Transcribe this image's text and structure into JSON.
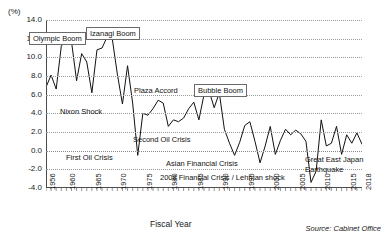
{
  "unit_label": "(%)",
  "axis_title": "Fiscal Year",
  "source": "Source: Cabinet Office",
  "annotations": {
    "olympic_boom": "Olympic Boom",
    "izanagi_boom": "Izanagi Boom",
    "nixon_shock": "Nixon Shock",
    "plaza_accord": "Plaza Accord",
    "bubble_boom": "Bubble Boom",
    "first_oil_crisis": "First Oil Crisis",
    "second_oil_crisis": "Second Oil Crisis",
    "asian_financial_crisis": "Asian Financial Crisis",
    "lehman": "2008 Financial Crisis /  Lehman shock",
    "great_east_japan": "Great East Japan Earthquake"
  },
  "chart_data": {
    "type": "line",
    "title": "",
    "xlabel": "Fiscal Year",
    "ylabel": "(%)",
    "ylim": [
      -4.0,
      14.0
    ],
    "ytick_values": [
      -4.0,
      -2.0,
      0.0,
      2.0,
      4.0,
      6.0,
      8.0,
      10.0,
      12.0,
      14.0
    ],
    "ytick_labels": [
      "-4.0",
      "-2.0",
      "0.0",
      "2.0",
      "4.0",
      "6.0",
      "8.0",
      "10.0",
      "12.0",
      "14.0"
    ],
    "xlim": [
      1956,
      2018
    ],
    "xtick_labels": [
      "1956",
      "1960",
      "1965",
      "1970",
      "1975",
      "1980",
      "1985",
      "1990",
      "1995",
      "2000",
      "2005",
      "2010",
      "2015",
      "2018"
    ],
    "xtick_values": [
      1956,
      1960,
      1965,
      1970,
      1975,
      1980,
      1985,
      1990,
      1995,
      2000,
      2005,
      2010,
      2015,
      2018
    ],
    "grid": true,
    "legend": false,
    "x": [
      1956,
      1957,
      1958,
      1959,
      1960,
      1961,
      1962,
      1963,
      1964,
      1965,
      1966,
      1967,
      1968,
      1969,
      1970,
      1971,
      1972,
      1973,
      1974,
      1975,
      1976,
      1977,
      1978,
      1979,
      1980,
      1981,
      1982,
      1983,
      1984,
      1985,
      1986,
      1987,
      1988,
      1989,
      1990,
      1991,
      1992,
      1993,
      1994,
      1995,
      1996,
      1997,
      1998,
      1999,
      2000,
      2001,
      2002,
      2003,
      2004,
      2005,
      2006,
      2007,
      2008,
      2009,
      2010,
      2011,
      2012,
      2013,
      2014,
      2015,
      2016,
      2017,
      2018
    ],
    "values": [
      6.8,
      8.1,
      6.6,
      11.2,
      11.9,
      11.7,
      7.5,
      10.4,
      9.5,
      6.2,
      10.8,
      11.0,
      12.2,
      12.0,
      8.2,
      5.0,
      9.1,
      5.1,
      -0.5,
      4.0,
      3.8,
      4.5,
      5.4,
      5.1,
      2.6,
      3.3,
      3.1,
      3.5,
      4.5,
      5.2,
      3.3,
      6.0,
      6.4,
      4.6,
      6.2,
      2.3,
      0.8,
      -0.5,
      0.9,
      2.7,
      3.1,
      1.0,
      -1.3,
      0.5,
      2.6,
      -0.4,
      1.1,
      2.3,
      1.7,
      2.2,
      1.8,
      1.0,
      -3.4,
      -2.2,
      3.3,
      0.5,
      0.8,
      2.6,
      -0.4,
      1.7,
      0.8,
      1.9,
      0.7
    ],
    "series": [
      {
        "name": "Real GDP growth rate",
        "color": "#111111"
      }
    ]
  }
}
